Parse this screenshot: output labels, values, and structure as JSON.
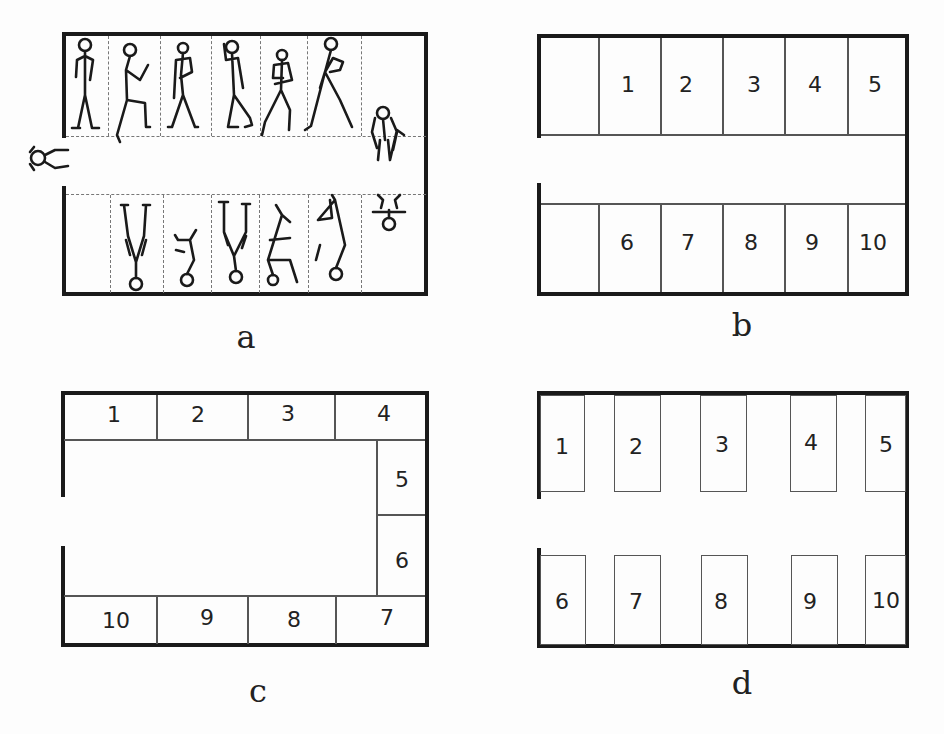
{
  "panels": {
    "a": {
      "caption": "a",
      "description": "Stick figures in stalls, entering through a gap on the left wall",
      "top_row_figures": 6,
      "bottom_row_figures": 5,
      "extra_figures": [
        "figure-at-entrance",
        "figure-right-end-top",
        "figure-right-end-bottom"
      ]
    },
    "b": {
      "caption": "b",
      "top_row": [
        "1",
        "2",
        "3",
        "4",
        "5"
      ],
      "bottom_row": [
        "6",
        "7",
        "8",
        "9",
        "10"
      ]
    },
    "c": {
      "caption": "c",
      "top_row": [
        "1",
        "2",
        "3",
        "4"
      ],
      "right_column": [
        "5",
        "6"
      ],
      "bottom_row": [
        "10",
        "9",
        "8",
        "7"
      ]
    },
    "d": {
      "caption": "d",
      "top_row": [
        "1",
        "2",
        "3",
        "4",
        "5"
      ],
      "bottom_row": [
        "6",
        "7",
        "8",
        "9",
        "10"
      ]
    }
  }
}
